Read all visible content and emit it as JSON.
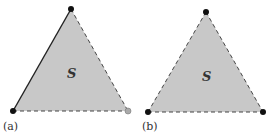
{
  "panels": [
    {
      "id": "a",
      "label": "(a)",
      "region_label": "S",
      "vertices": [
        [
          71,
          9
        ],
        [
          13,
          111
        ],
        [
          128,
          111
        ]
      ],
      "edges": [
        {
          "from": 0,
          "to": 1,
          "style": "solid"
        },
        {
          "from": 0,
          "to": 2,
          "style": "dashed"
        },
        {
          "from": 1,
          "to": 2,
          "style": "dashed"
        }
      ],
      "vertex_colors": [
        "#111111",
        "#111111",
        "#999999"
      ]
    },
    {
      "id": "b",
      "label": "(b)",
      "region_label": "S",
      "vertices": [
        [
          206,
          12
        ],
        [
          148,
          112
        ],
        [
          263,
          112
        ]
      ],
      "edges": [
        {
          "from": 0,
          "to": 1,
          "style": "dashed"
        },
        {
          "from": 0,
          "to": 2,
          "style": "dashed"
        },
        {
          "from": 1,
          "to": 2,
          "style": "dashed"
        }
      ],
      "vertex_colors": [
        "#111111",
        "#111111",
        "#111111"
      ]
    }
  ],
  "colors": {
    "fill": "#c8c8c8",
    "line": "#222222"
  }
}
